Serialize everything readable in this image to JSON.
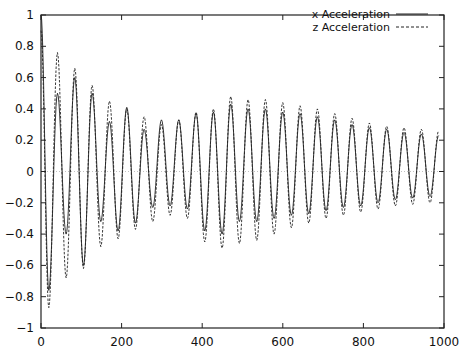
{
  "chart_data": {
    "type": "line",
    "title": "",
    "xlabel": "",
    "ylabel": "",
    "xlim": [
      0,
      1000
    ],
    "ylim": [
      -1,
      1
    ],
    "grid": false,
    "zero_line": true,
    "legend_position": "top-right",
    "x_ticks": [
      0,
      200,
      400,
      600,
      800,
      1000
    ],
    "x_tick_labels": [
      "0",
      "200",
      "400",
      "600",
      "800",
      "1000"
    ],
    "y_ticks": [
      -1,
      -0.8,
      -0.6,
      -0.4,
      -0.2,
      0,
      0.2,
      0.4,
      0.6,
      0.8,
      1
    ],
    "y_tick_labels": [
      "−1",
      "−0.8",
      "−0.6",
      "−0.4",
      "−0.2",
      "0",
      "0.2",
      "0.4",
      "0.6",
      "0.8",
      "1"
    ],
    "period": 43,
    "series": [
      {
        "name": "x Acceleration",
        "style": "solid",
        "start_value": 1.0,
        "peaks": [
          0.5,
          0.6,
          0.5,
          0.32,
          0.41,
          0.27,
          0.33,
          0.33,
          0.37,
          0.38,
          0.43,
          0.4,
          0.4,
          0.38,
          0.37,
          0.35,
          0.33,
          0.3,
          0.28,
          0.27,
          0.25,
          0.24,
          0.23
        ],
        "troughs": [
          -0.76,
          -0.4,
          -0.6,
          -0.32,
          -0.38,
          -0.33,
          -0.23,
          -0.22,
          -0.24,
          -0.38,
          -0.4,
          -0.32,
          -0.32,
          -0.3,
          -0.28,
          -0.27,
          -0.25,
          -0.23,
          -0.22,
          -0.2,
          -0.18,
          -0.17,
          -0.16
        ]
      },
      {
        "name": "z Acceleration",
        "style": "dashed",
        "start_value": 0.9,
        "peaks": [
          0.76,
          0.66,
          0.55,
          0.45,
          0.4,
          0.35,
          0.3,
          0.33,
          0.38,
          0.4,
          0.48,
          0.46,
          0.46,
          0.44,
          0.42,
          0.4,
          0.37,
          0.34,
          0.31,
          0.29,
          0.28,
          0.27,
          0.26
        ],
        "troughs": [
          -0.87,
          -0.68,
          -0.62,
          -0.48,
          -0.43,
          -0.37,
          -0.32,
          -0.28,
          -0.3,
          -0.45,
          -0.49,
          -0.46,
          -0.44,
          -0.4,
          -0.36,
          -0.33,
          -0.3,
          -0.28,
          -0.26,
          -0.24,
          -0.22,
          -0.21,
          -0.2
        ]
      }
    ]
  }
}
